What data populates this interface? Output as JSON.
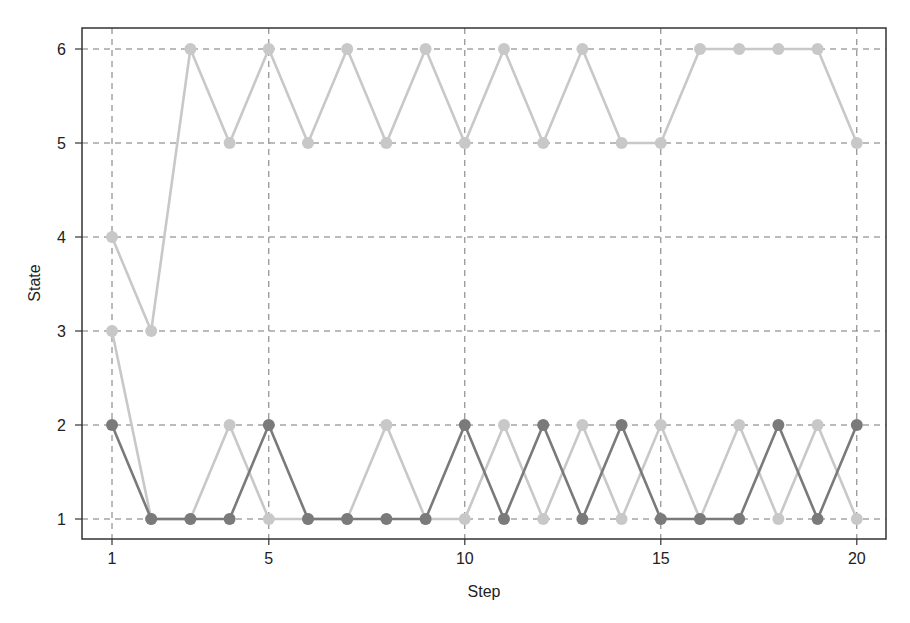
{
  "chart_data": {
    "type": "line",
    "title": "",
    "xlabel": "Step",
    "ylabel": "State",
    "x": [
      1,
      2,
      3,
      4,
      5,
      6,
      7,
      8,
      9,
      10,
      11,
      12,
      13,
      14,
      15,
      16,
      17,
      18,
      19,
      20
    ],
    "xticks": [
      1,
      5,
      10,
      15,
      20
    ],
    "yticks": [
      1,
      2,
      3,
      4,
      5,
      6
    ],
    "xlim": [
      0.2,
      20.7
    ],
    "ylim": [
      0.78,
      6.25
    ],
    "grid": true,
    "legend": null,
    "series": [
      {
        "name": "upper-light",
        "color": "#c8c8c8",
        "values": [
          4,
          3,
          6,
          5,
          6,
          5,
          6,
          5,
          6,
          5,
          6,
          5,
          6,
          5,
          5,
          6,
          6,
          6,
          6,
          5
        ]
      },
      {
        "name": "lower-light",
        "color": "#c8c8c8",
        "values": [
          3,
          1,
          1,
          2,
          1,
          1,
          1,
          2,
          1,
          1,
          2,
          1,
          2,
          1,
          2,
          1,
          2,
          1,
          2,
          1
        ]
      },
      {
        "name": "lower-dark",
        "color": "#7a7a7a",
        "values": [
          2,
          1,
          1,
          1,
          2,
          1,
          1,
          1,
          1,
          2,
          1,
          2,
          1,
          2,
          1,
          1,
          1,
          2,
          1,
          2
        ]
      }
    ]
  },
  "labels": {
    "xlabel": "Step",
    "ylabel": "State"
  }
}
